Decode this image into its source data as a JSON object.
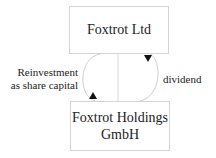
{
  "diagram": {
    "nodes": [
      {
        "id": "top",
        "label": "Foxtrot Ltd"
      },
      {
        "id": "bottom",
        "label_line1": "Foxtrot Holdings",
        "label_line2": "GmbH"
      }
    ],
    "edges": [
      {
        "from": "bottom",
        "to": "top",
        "label_line1": "Reinvestment",
        "label_line2": "as share capital"
      },
      {
        "from": "top",
        "to": "bottom",
        "label": "dividend"
      }
    ]
  }
}
